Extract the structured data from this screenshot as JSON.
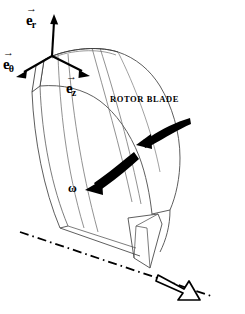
{
  "figure": {
    "background_color": "#ffffff",
    "line_color": "#000000",
    "surface_line_color": "#666666"
  },
  "axes_triad": {
    "origin": {
      "x": 52,
      "y": 56
    },
    "vectors": [
      {
        "id": "e_r",
        "symbol": "e",
        "subscript": "r",
        "accent": "→",
        "label": "e⃗_r",
        "direction": "up",
        "tip": {
          "x": 54,
          "y": 16
        }
      },
      {
        "id": "e_theta",
        "symbol": "e",
        "subscript": "θ",
        "accent": "→",
        "label": "e⃗_θ",
        "direction": "down-left",
        "tip": {
          "x": 18,
          "y": 76
        }
      },
      {
        "id": "e_z",
        "symbol": "e",
        "subscript": "z",
        "accent": "→",
        "label": "e⃗_z",
        "direction": "down-right",
        "tip": {
          "x": 88,
          "y": 75
        }
      }
    ]
  },
  "labels": {
    "rotor_blade": "ROTOR BLADE",
    "omega": "ω",
    "omega_vector": {
      "vec_symbol": "ω",
      "accent": "→",
      "equals": "=",
      "scalar": "ω",
      "basis_symbol": "e",
      "basis_sub": "z",
      "full": "ω⃗ = ω e⃗_z"
    }
  },
  "annotations": {
    "rotation_arrows": [
      {
        "id": "upper-rotation-arrow",
        "from": {
          "x": 188,
          "y": 119
        },
        "to": {
          "x": 143,
          "y": 143
        },
        "style": "solid-filled"
      },
      {
        "id": "lower-rotation-arrow",
        "from": {
          "x": 133,
          "y": 154
        },
        "to": {
          "x": 80,
          "y": 189
        },
        "style": "solid-filled"
      }
    ],
    "axis_line": {
      "id": "rotation-axis-centerline",
      "style": "dash-dot",
      "from": {
        "x": 20,
        "y": 232
      },
      "to": {
        "x": 212,
        "y": 296
      }
    },
    "omega_arrow": {
      "id": "omega-vector-arrow",
      "style": "outlined-hollow",
      "from": {
        "x": 160,
        "y": 277
      },
      "to": {
        "x": 197,
        "y": 299
      }
    }
  }
}
